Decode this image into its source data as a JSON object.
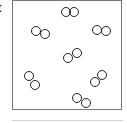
{
  "label": "t",
  "molecules": [
    {
      "c1": [
        66,
        12
      ],
      "c2": [
        74,
        12
      ]
    },
    {
      "c1": [
        36,
        31
      ],
      "c2": [
        45,
        34
      ]
    },
    {
      "c1": [
        97,
        30
      ],
      "c2": [
        106,
        31
      ]
    },
    {
      "c1": [
        68,
        58
      ],
      "c2": [
        77,
        53
      ]
    },
    {
      "c1": [
        29,
        76
      ],
      "c2": [
        35,
        85
      ]
    },
    {
      "c1": [
        95,
        82
      ],
      "c2": [
        102,
        75
      ]
    },
    {
      "c1": [
        77,
        98
      ],
      "c2": [
        86,
        103
      ]
    }
  ],
  "circle_radius": 4.5,
  "stroke_color": "#222222"
}
